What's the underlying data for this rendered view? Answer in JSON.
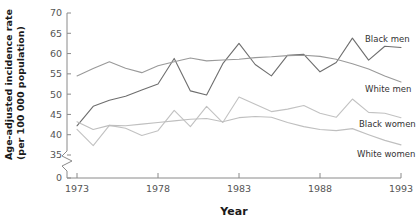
{
  "chart_data": {
    "type": "line",
    "title": "",
    "xlabel": "Year",
    "ylabel": "Age-adjusted incidence rate\n(per 100 000 population)",
    "ylabel_line1": "Age-adjusted incidence rate",
    "ylabel_line2": "(per 100 000 population)",
    "xlim": [
      1973,
      1993
    ],
    "ylim": [
      35,
      70
    ],
    "y_axis_break": true,
    "y_break_from": 0,
    "y_break_to": 35,
    "grid": false,
    "legend_position": "right-inline",
    "xticks": [
      "1973",
      "1978",
      "1983",
      "1988",
      "1993"
    ],
    "xtick_values": [
      1973,
      1978,
      1983,
      1988,
      1993
    ],
    "yticks": [
      "0",
      "35",
      "40",
      "45",
      "50",
      "55",
      "60",
      "65",
      "70"
    ],
    "ytick_values": [
      0,
      35,
      40,
      45,
      50,
      55,
      60,
      65,
      70
    ],
    "x": [
      1973,
      1974,
      1975,
      1976,
      1977,
      1978,
      1979,
      1980,
      1981,
      1982,
      1983,
      1984,
      1985,
      1986,
      1987,
      1988,
      1989,
      1990,
      1991,
      1992,
      1993
    ],
    "series": [
      {
        "name": "Black men",
        "label": "Black men",
        "color": "#6e6e6e",
        "values": [
          42.2,
          47.0,
          48.5,
          49.5,
          51.0,
          52.5,
          58.8,
          50.8,
          49.8,
          57.5,
          62.5,
          57.3,
          54.5,
          59.6,
          59.8,
          55.5,
          57.8,
          63.8,
          58.4,
          61.8,
          61.5
        ]
      },
      {
        "name": "White men",
        "label": "White men",
        "color": "#9a9a9a",
        "values": [
          54.5,
          56.3,
          58.0,
          56.4,
          55.3,
          57.0,
          58.0,
          58.9,
          58.2,
          58.4,
          58.6,
          59.0,
          59.2,
          59.5,
          59.6,
          59.3,
          58.6,
          57.5,
          56.2,
          54.5,
          53.0
        ]
      },
      {
        "name": "Black women",
        "label": "Black women",
        "color": "#c2c2c2",
        "values": [
          41.3,
          37.3,
          42.3,
          41.6,
          39.8,
          41.0,
          46.0,
          42.0,
          47.0,
          43.0,
          49.3,
          47.5,
          45.7,
          46.3,
          47.2,
          45.3,
          44.3,
          48.8,
          45.5,
          45.3,
          44.2
        ]
      },
      {
        "name": "White women",
        "label": "White women",
        "color": "#bfbfbf",
        "values": [
          43.2,
          41.3,
          42.3,
          42.2,
          42.6,
          43.0,
          43.4,
          43.8,
          44.0,
          43.2,
          44.2,
          44.5,
          44.3,
          43.0,
          42.0,
          41.3,
          41.0,
          41.5,
          40.0,
          38.6,
          37.5
        ]
      }
    ]
  },
  "axis": {
    "x_title": "Year",
    "y_title_line1": "Age-adjusted incidence rate",
    "y_title_line2": "(per 100 000 population)"
  }
}
